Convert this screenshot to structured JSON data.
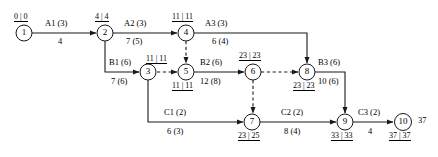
{
  "diagram": {
    "type": "activity-on-arrow-network",
    "title": "",
    "nodes": [
      {
        "id": "1",
        "label": "1",
        "times": "0 | 0",
        "times_pos": "above",
        "x": 24,
        "y": 33
      },
      {
        "id": "2",
        "label": "2",
        "times": "4 | 4",
        "times_pos": "above",
        "x": 105,
        "y": 33
      },
      {
        "id": "3",
        "label": "3",
        "times": "11 | 11",
        "times_pos": "above-right",
        "x": 148,
        "y": 72
      },
      {
        "id": "4",
        "label": "4",
        "times": "11 | 11",
        "times_pos": "above",
        "x": 186,
        "y": 33
      },
      {
        "id": "5",
        "label": "5",
        "times": "11 | 11",
        "times_pos": "below",
        "x": 186,
        "y": 72
      },
      {
        "id": "6",
        "label": "6",
        "times": "23 | 23",
        "times_pos": "above",
        "x": 253,
        "y": 72
      },
      {
        "id": "7",
        "label": "7",
        "times": "23 | 25",
        "times_pos": "below",
        "x": 252,
        "y": 122
      },
      {
        "id": "8",
        "label": "8",
        "times": "23 | 23",
        "times_pos": "below",
        "x": 307,
        "y": 72
      },
      {
        "id": "9",
        "label": "9",
        "times": "33 | 33",
        "times_pos": "below",
        "x": 345,
        "y": 122
      },
      {
        "id": "10",
        "label": "10",
        "times": "37 | 37",
        "times_pos": "below",
        "x": 403,
        "y": 122
      }
    ],
    "activities": [
      {
        "name": "A1 (3)",
        "value": "4",
        "from": "1",
        "to": "2",
        "style": "solid"
      },
      {
        "name": "A2 (3)",
        "value": "7 (5)",
        "from": "2",
        "to": "4",
        "style": "solid"
      },
      {
        "name": "A3 (3)",
        "value": "6 (4)",
        "from": "4",
        "to": "8",
        "style": "solid"
      },
      {
        "name": "B1 (6)",
        "value": "7 (6)",
        "from": "2",
        "to": "3",
        "style": "solid"
      },
      {
        "name": "B2 (6)",
        "value": "12 (8)",
        "from": "5",
        "to": "6",
        "style": "solid"
      },
      {
        "name": "B3 (6)",
        "value": "10 (6)",
        "from": "8",
        "to": "9",
        "style": "solid"
      },
      {
        "name": "C1 (2)",
        "value": "6 (3)",
        "from": "3",
        "to": "7",
        "style": "solid"
      },
      {
        "name": "C2 (2)",
        "value": "8 (4)",
        "from": "7",
        "to": "9",
        "style": "solid"
      },
      {
        "name": "C3 (2)",
        "value": "4",
        "from": "9",
        "to": "10",
        "style": "solid"
      }
    ],
    "dummy_links": [
      {
        "from": "4",
        "to": "5",
        "style": "dashed"
      },
      {
        "from": "3",
        "to": "5",
        "style": "dashed"
      },
      {
        "from": "6",
        "to": "8",
        "style": "dashed"
      },
      {
        "from": "6",
        "to": "7",
        "style": "dashed"
      }
    ],
    "annotations": [
      {
        "text": "37",
        "x": 418,
        "y": 116
      }
    ],
    "colors": {
      "line": "#1a1a1a",
      "node_fill": "#ffffff",
      "text": "#000000",
      "background": "#ffffff"
    }
  }
}
